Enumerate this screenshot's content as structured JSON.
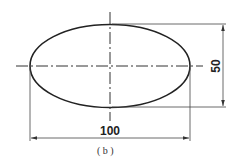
{
  "figure": {
    "caption": "( b )",
    "shape": "ellipse",
    "dimensions": {
      "width_label": "100",
      "height_label": "50"
    },
    "colors": {
      "stroke": "#222222",
      "background": "#ffffff"
    }
  }
}
